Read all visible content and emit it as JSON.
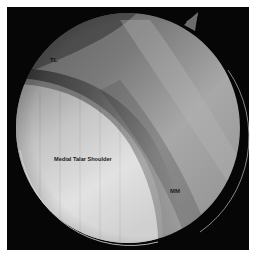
{
  "image": {
    "description": "Arthroscopic view of ankle joint inside circular scope field on black frame",
    "background_color": "#ffffff",
    "frame_color": "#060606"
  },
  "labels": {
    "tl": "TL",
    "medial_talar_shoulder": "Medial Talar Shoulder",
    "mm": "MM"
  },
  "colors": {
    "talus_light": "#e4e4e4",
    "talus_mid": "#b8b8b8",
    "tissue_dark": "#3a3a3a",
    "tissue_mid": "#8a8a8a",
    "tissue_light": "#b2b2b2",
    "rim_highlight": "#d8d8d8"
  }
}
